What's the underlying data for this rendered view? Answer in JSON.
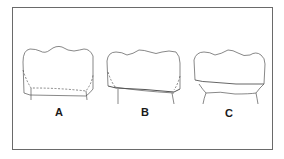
{
  "figure": {
    "type": "line-drawing",
    "panels": [
      {
        "id": "A",
        "label": "A",
        "description": "crown with dashed internal line above margin, roots below"
      },
      {
        "id": "B",
        "label": "B",
        "description": "crown with dashed sides meeting a double margin line"
      },
      {
        "id": "C",
        "label": "C",
        "description": "crown with solid sloped margin line above wider neck"
      }
    ],
    "colors": {
      "line": "#555555",
      "frame": "#6a6a6a",
      "label": "#1a1a1a",
      "background": "#ffffff"
    }
  }
}
